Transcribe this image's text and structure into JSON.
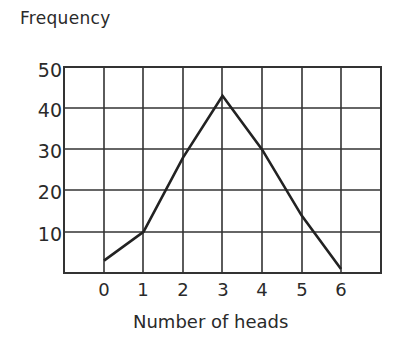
{
  "chart_data": {
    "type": "line",
    "title": "Frequency",
    "xlabel": "Number of heads",
    "ylabel": "Frequency",
    "x": [
      0,
      1,
      2,
      3,
      4,
      5,
      6
    ],
    "values": [
      3,
      10,
      28,
      43,
      30,
      14,
      1
    ],
    "xticks": [
      "0",
      "1",
      "2",
      "3",
      "4",
      "5",
      "6"
    ],
    "yticks": [
      "10",
      "20",
      "30",
      "40",
      "50"
    ],
    "ylim": [
      0,
      50
    ],
    "xlim": [
      -1,
      7
    ],
    "grid": true,
    "legend": null
  },
  "labels": {
    "y_axis_title": "Frequency",
    "x_axis_title": "Number of heads",
    "y_ticks": [
      "50",
      "40",
      "30",
      "20",
      "10"
    ],
    "x_ticks": [
      "0",
      "1",
      "2",
      "3",
      "4",
      "5",
      "6"
    ]
  },
  "colors": {
    "line": "#222222",
    "grid": "#333333",
    "background": "#ffffff"
  }
}
